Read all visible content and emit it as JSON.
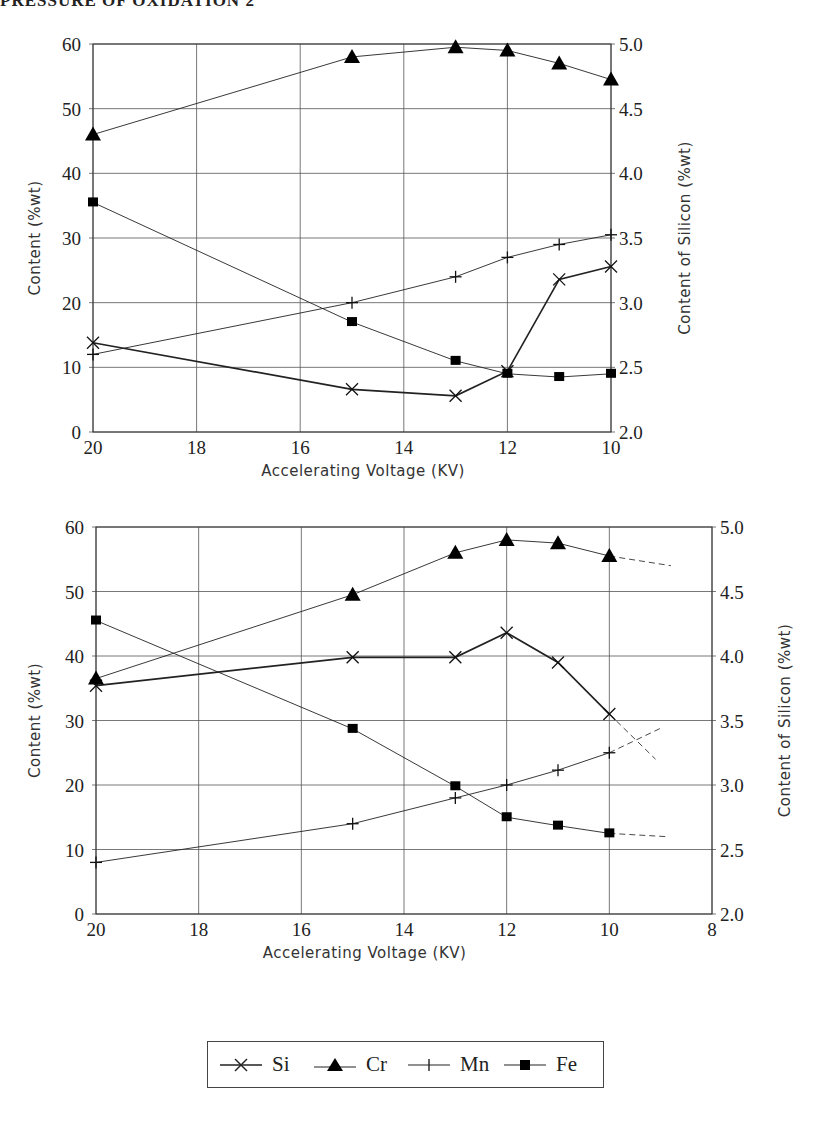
{
  "header": {
    "title_partial": "PRESSURE OF OXIDATION 2"
  },
  "legend": {
    "items": [
      {
        "label": "Si",
        "marker": "x-mark-icon"
      },
      {
        "label": "Cr",
        "marker": "filled-triangle-icon"
      },
      {
        "label": "Mn",
        "marker": "plus-mark-icon"
      },
      {
        "label": "Fe",
        "marker": "filled-square-icon"
      }
    ]
  },
  "chart_data": [
    {
      "type": "line",
      "title": "",
      "xlabel": "Accelerating Voltage (KV)",
      "ylabel": "Content (%wt)",
      "y2label": "Content of Silicon (%wt)",
      "xlim": [
        20,
        10
      ],
      "x_reversed": true,
      "ylim": [
        0,
        60
      ],
      "y2lim": [
        2.0,
        5.0
      ],
      "x_ticks": [
        "20",
        "18",
        "16",
        "14",
        "12",
        "10"
      ],
      "y_ticks": [
        "0",
        "10",
        "20",
        "30",
        "40",
        "50",
        "60"
      ],
      "y2_ticks": [
        "2.0",
        "2.5",
        "3.0",
        "3.5",
        "4.0",
        "4.5",
        "5.0"
      ],
      "grid": true,
      "legend_position": "bottom",
      "x": [
        20,
        15,
        13,
        12,
        11,
        10
      ],
      "series": [
        {
          "name": "Si",
          "axis": "right",
          "values": [
            2.69,
            2.33,
            2.28,
            2.47,
            3.18,
            3.28
          ]
        },
        {
          "name": "Cr",
          "axis": "left",
          "values": [
            46,
            58,
            59.5,
            59,
            57,
            54.5
          ]
        },
        {
          "name": "Mn",
          "axis": "left",
          "values": [
            12,
            20,
            24,
            27,
            29,
            30.5
          ]
        },
        {
          "name": "Fe",
          "axis": "left",
          "values": [
            35.5,
            17,
            11,
            9,
            8.5,
            9
          ]
        }
      ]
    },
    {
      "type": "line",
      "title": "",
      "xlabel": "Accelerating Voltage (KV)",
      "ylabel": "Content (%wt)",
      "y2label": "Content of Silicon (%wt)",
      "xlim": [
        20,
        8
      ],
      "x_reversed": true,
      "ylim": [
        0,
        60
      ],
      "y2lim": [
        2.0,
        5.0
      ],
      "x_ticks": [
        "20",
        "18",
        "16",
        "14",
        "12",
        "10",
        "8"
      ],
      "y_ticks": [
        "0",
        "10",
        "20",
        "30",
        "40",
        "50",
        "60"
      ],
      "y2_ticks": [
        "2.0",
        "2.5",
        "3.0",
        "3.5",
        "4.0",
        "4.5",
        "5.0"
      ],
      "grid": true,
      "legend_position": "bottom",
      "x": [
        20,
        15,
        13,
        12,
        11,
        10
      ],
      "series": [
        {
          "name": "Si",
          "axis": "right",
          "values": [
            3.77,
            3.99,
            3.99,
            4.18,
            3.95,
            3.55
          ],
          "dashed_extension": {
            "x": 9.1,
            "value": 3.2
          }
        },
        {
          "name": "Cr",
          "axis": "left",
          "values": [
            36.5,
            49.5,
            56,
            58,
            57.5,
            55.5
          ],
          "dashed_extension": {
            "x": 8.8,
            "value": 54
          }
        },
        {
          "name": "Mn",
          "axis": "left",
          "values": [
            8,
            14,
            18,
            20,
            22.3,
            25
          ],
          "dashed_extension": {
            "x": 9.0,
            "value": 28.8
          }
        },
        {
          "name": "Fe",
          "axis": "left",
          "values": [
            45.5,
            28.7,
            19.8,
            15,
            13.7,
            12.5
          ],
          "dashed_extension": {
            "x": 8.9,
            "value": 12
          }
        }
      ]
    }
  ]
}
